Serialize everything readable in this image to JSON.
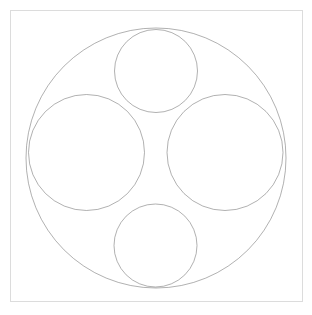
{
  "figure": {
    "type": "apollonian-circle-packing",
    "canvas": {
      "width": 312,
      "height": 315,
      "background": "#ffffff"
    },
    "frame": {
      "x": 10,
      "y": 10,
      "width": 292,
      "height": 291,
      "stroke": "#dcdcdc",
      "stroke_width": 1,
      "fill": "none"
    },
    "style": {
      "stroke": "#6f6f6f",
      "stroke_width": 0.55,
      "fill": "none"
    },
    "recursion": {
      "max_depth": 9,
      "min_radius_px": 0.55
    },
    "outer_circle": {
      "label": "bounding-circle",
      "cx": 156.0,
      "cy": 158.0,
      "r": 130.0,
      "curvature": -0.0076923077
    },
    "primary_circles": [
      {
        "label": "top-circle",
        "cx": 156.0,
        "cy": 71.0,
        "r": 41.5
      },
      {
        "label": "left-circle",
        "cx": 86.5,
        "cy": 152.5,
        "r": 58.0
      },
      {
        "label": "right-circle",
        "cx": 225.0,
        "cy": 152.5,
        "r": 58.0
      },
      {
        "label": "bottom-circle",
        "cx": 155.5,
        "cy": 245.5,
        "r": 41.5
      }
    ],
    "seed_triples": [
      {
        "label": "top-left-gap",
        "members": [
          "outer",
          "top",
          "left"
        ]
      },
      {
        "label": "top-right-gap",
        "members": [
          "outer",
          "top",
          "right"
        ]
      },
      {
        "label": "bottom-left-gap",
        "members": [
          "outer",
          "bottom",
          "left"
        ]
      },
      {
        "label": "bottom-right-gap",
        "members": [
          "outer",
          "bottom",
          "right"
        ]
      },
      {
        "label": "center-upper-gap",
        "members": [
          "top",
          "left",
          "right"
        ]
      },
      {
        "label": "center-lower-gap",
        "members": [
          "bottom",
          "left",
          "right"
        ]
      }
    ]
  }
}
